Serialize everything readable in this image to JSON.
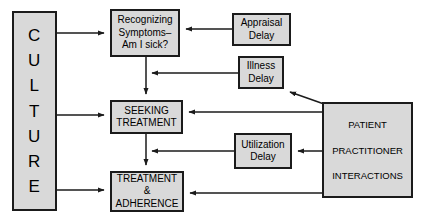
{
  "diagram": {
    "style": {
      "node_fill": "#d9d9d9",
      "node_stroke": "#1b1b1b",
      "edge_color": "#1b1b1b",
      "background": "#ffffff"
    },
    "nodes": [
      {
        "id": "culture",
        "label": "CULTURE",
        "letters": [
          "C",
          "U",
          "L",
          "T",
          "U",
          "R",
          "E"
        ],
        "orientation": "vertical"
      },
      {
        "id": "recognizing",
        "lines": [
          "Recognizing",
          "Symptoms–",
          "Am I sick?"
        ]
      },
      {
        "id": "seeking",
        "lines": [
          "SEEKING",
          "TREATMENT"
        ]
      },
      {
        "id": "treatment",
        "lines": [
          "TREATMENT",
          "&",
          "ADHERENCE"
        ]
      },
      {
        "id": "appraisal",
        "lines": [
          "Appraisal",
          "Delay"
        ]
      },
      {
        "id": "illness",
        "lines": [
          "Illness",
          "Delay"
        ]
      },
      {
        "id": "utilization",
        "lines": [
          "Utilization",
          "Delay"
        ]
      },
      {
        "id": "ppi",
        "lines": [
          "PATIENT",
          "PRACTITIONER",
          "INTERACTIONS"
        ]
      }
    ],
    "edges": [
      {
        "from": "culture",
        "to": "recognizing",
        "type": "arrow"
      },
      {
        "from": "culture",
        "to": "seeking",
        "type": "arrow"
      },
      {
        "from": "culture",
        "to": "treatment",
        "type": "arrow"
      },
      {
        "from": "recognizing",
        "to": "seeking",
        "type": "arrow"
      },
      {
        "from": "seeking",
        "to": "treatment",
        "type": "arrow"
      },
      {
        "from": "appraisal",
        "to": "recognizing",
        "type": "arrow"
      },
      {
        "from": "illness",
        "to": "seeking-path",
        "type": "arrow"
      },
      {
        "from": "ppi",
        "to": "illness",
        "type": "arrow"
      },
      {
        "from": "ppi",
        "to": "seeking",
        "type": "arrow"
      },
      {
        "from": "ppi",
        "to": "utilization",
        "type": "arrow"
      },
      {
        "from": "utilization",
        "to": "treatment-path",
        "type": "arrow"
      },
      {
        "from": "ppi",
        "to": "treatment",
        "type": "arrow"
      }
    ]
  }
}
